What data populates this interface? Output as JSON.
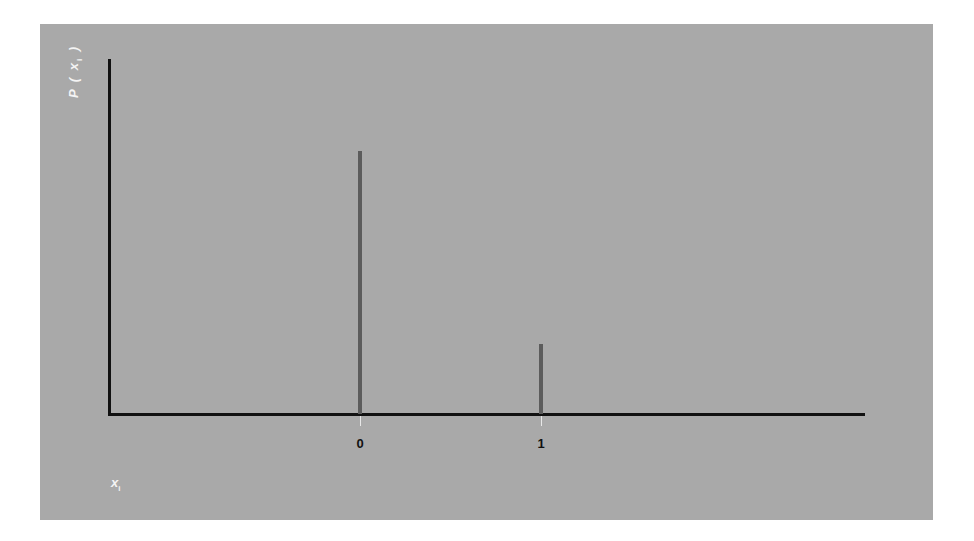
{
  "chart": {
    "ylabel_main": "P ( x",
    "ylabel_sub": "i",
    "ylabel_close": " )",
    "xlabel_main": "x",
    "xlabel_sub": "i",
    "tick_labels": [
      "0",
      "1"
    ],
    "colors": {
      "background": "#a9a9a9",
      "axis": "#111111",
      "stem": "#5c5c5c",
      "label": "#f4f4f4"
    }
  },
  "chart_data": {
    "type": "bar",
    "subtype": "stem / probability mass function",
    "title": "",
    "categories": [
      "0",
      "1"
    ],
    "x": [
      0,
      1
    ],
    "values": [
      0.79,
      0.21
    ],
    "xlabel": "x_i",
    "ylabel": "P(x_i)",
    "ylim": [
      0,
      1.07
    ],
    "y_ticks": [],
    "grid": false,
    "legend": null
  }
}
